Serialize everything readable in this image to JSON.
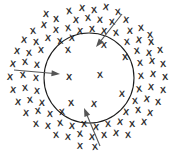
{
  "figure": {
    "title": "",
    "background_color": "#ffffff",
    "marker_glyph": "X",
    "marker_color": "#2b2b2b",
    "boundary_color": "#1c1c1c",
    "arrow_color": "#555555",
    "canvas": {
      "width": 174,
      "height": 152
    }
  },
  "boundary": {
    "shape": "circle",
    "center_x": 89,
    "center_y": 78,
    "radius": 45,
    "stroke_width": 1.1
  },
  "markers_inside": [
    {
      "x": 68,
      "y": 50,
      "size": 9,
      "rotation": -6
    },
    {
      "x": 104,
      "y": 45,
      "size": 9,
      "rotation": 4
    },
    {
      "x": 125,
      "y": 57,
      "size": 9,
      "rotation": -3
    },
    {
      "x": 69,
      "y": 77,
      "size": 9,
      "rotation": 2
    },
    {
      "x": 100,
      "y": 75,
      "size": 9,
      "rotation": -5
    },
    {
      "x": 122,
      "y": 94,
      "size": 9,
      "rotation": 3
    },
    {
      "x": 71,
      "y": 103,
      "size": 9,
      "rotation": -4
    },
    {
      "x": 94,
      "y": 104,
      "size": 9,
      "rotation": 5
    }
  ],
  "markers_outside": [
    {
      "x": 69,
      "y": 11,
      "size": 9,
      "rotation": -8
    },
    {
      "x": 82,
      "y": 8,
      "size": 9,
      "rotation": 6
    },
    {
      "x": 94,
      "y": 10,
      "size": 9,
      "rotation": -4
    },
    {
      "x": 106,
      "y": 7,
      "size": 9,
      "rotation": 9
    },
    {
      "x": 118,
      "y": 12,
      "size": 9,
      "rotation": -6
    },
    {
      "x": 76,
      "y": 20,
      "size": 9,
      "rotation": 5
    },
    {
      "x": 88,
      "y": 18,
      "size": 9,
      "rotation": -7
    },
    {
      "x": 100,
      "y": 20,
      "size": 9,
      "rotation": 3
    },
    {
      "x": 112,
      "y": 22,
      "size": 9,
      "rotation": -5
    },
    {
      "x": 126,
      "y": 20,
      "size": 9,
      "rotation": 7
    },
    {
      "x": 56,
      "y": 19,
      "size": 9,
      "rotation": -3
    },
    {
      "x": 44,
      "y": 25,
      "size": 9,
      "rotation": 8
    },
    {
      "x": 33,
      "y": 31,
      "size": 9,
      "rotation": -6
    },
    {
      "x": 56,
      "y": 30,
      "size": 9,
      "rotation": 4
    },
    {
      "x": 68,
      "y": 28,
      "size": 9,
      "rotation": -9
    },
    {
      "x": 80,
      "y": 31,
      "size": 9,
      "rotation": 5
    },
    {
      "x": 92,
      "y": 29,
      "size": 9,
      "rotation": -4
    },
    {
      "x": 104,
      "y": 31,
      "size": 9,
      "rotation": 6
    },
    {
      "x": 116,
      "y": 33,
      "size": 9,
      "rotation": -7
    },
    {
      "x": 130,
      "y": 31,
      "size": 9,
      "rotation": 3
    },
    {
      "x": 141,
      "y": 28,
      "size": 9,
      "rotation": -5
    },
    {
      "x": 24,
      "y": 40,
      "size": 9,
      "rotation": 7
    },
    {
      "x": 36,
      "y": 42,
      "size": 9,
      "rotation": -4
    },
    {
      "x": 48,
      "y": 38,
      "size": 9,
      "rotation": 5
    },
    {
      "x": 60,
      "y": 41,
      "size": 9,
      "rotation": -8
    },
    {
      "x": 72,
      "y": 38,
      "size": 9,
      "rotation": 4
    },
    {
      "x": 127,
      "y": 42,
      "size": 9,
      "rotation": -6
    },
    {
      "x": 139,
      "y": 40,
      "size": 9,
      "rotation": 8
    },
    {
      "x": 151,
      "y": 42,
      "size": 9,
      "rotation": -3
    },
    {
      "x": 17,
      "y": 51,
      "size": 9,
      "rotation": 6
    },
    {
      "x": 29,
      "y": 53,
      "size": 9,
      "rotation": -5
    },
    {
      "x": 41,
      "y": 50,
      "size": 9,
      "rotation": 4
    },
    {
      "x": 137,
      "y": 51,
      "size": 9,
      "rotation": -7
    },
    {
      "x": 149,
      "y": 53,
      "size": 9,
      "rotation": 5
    },
    {
      "x": 160,
      "y": 50,
      "size": 9,
      "rotation": -4
    },
    {
      "x": 13,
      "y": 64,
      "size": 9,
      "rotation": 8
    },
    {
      "x": 25,
      "y": 62,
      "size": 9,
      "rotation": -6
    },
    {
      "x": 37,
      "y": 65,
      "size": 9,
      "rotation": 3
    },
    {
      "x": 140,
      "y": 63,
      "size": 9,
      "rotation": -5
    },
    {
      "x": 152,
      "y": 61,
      "size": 9,
      "rotation": 7
    },
    {
      "x": 163,
      "y": 64,
      "size": 9,
      "rotation": -4
    },
    {
      "x": 10,
      "y": 77,
      "size": 9,
      "rotation": 5
    },
    {
      "x": 23,
      "y": 75,
      "size": 9,
      "rotation": -7
    },
    {
      "x": 36,
      "y": 78,
      "size": 9,
      "rotation": 4
    },
    {
      "x": 141,
      "y": 76,
      "size": 9,
      "rotation": -6
    },
    {
      "x": 153,
      "y": 74,
      "size": 9,
      "rotation": 6
    },
    {
      "x": 165,
      "y": 77,
      "size": 9,
      "rotation": -3
    },
    {
      "x": 13,
      "y": 90,
      "size": 9,
      "rotation": 7
    },
    {
      "x": 25,
      "y": 88,
      "size": 9,
      "rotation": -5
    },
    {
      "x": 37,
      "y": 91,
      "size": 9,
      "rotation": 4
    },
    {
      "x": 139,
      "y": 89,
      "size": 9,
      "rotation": -8
    },
    {
      "x": 151,
      "y": 87,
      "size": 9,
      "rotation": 5
    },
    {
      "x": 163,
      "y": 90,
      "size": 9,
      "rotation": -4
    },
    {
      "x": 18,
      "y": 102,
      "size": 9,
      "rotation": 6
    },
    {
      "x": 30,
      "y": 100,
      "size": 9,
      "rotation": -6
    },
    {
      "x": 42,
      "y": 103,
      "size": 9,
      "rotation": 3
    },
    {
      "x": 135,
      "y": 101,
      "size": 9,
      "rotation": -5
    },
    {
      "x": 147,
      "y": 99,
      "size": 9,
      "rotation": 8
    },
    {
      "x": 158,
      "y": 102,
      "size": 9,
      "rotation": -4
    },
    {
      "x": 26,
      "y": 113,
      "size": 9,
      "rotation": 5
    },
    {
      "x": 38,
      "y": 111,
      "size": 9,
      "rotation": -7
    },
    {
      "x": 50,
      "y": 114,
      "size": 9,
      "rotation": 4
    },
    {
      "x": 62,
      "y": 112,
      "size": 9,
      "rotation": -5
    },
    {
      "x": 126,
      "y": 112,
      "size": 9,
      "rotation": 6
    },
    {
      "x": 138,
      "y": 110,
      "size": 9,
      "rotation": -4
    },
    {
      "x": 150,
      "y": 113,
      "size": 9,
      "rotation": 7
    },
    {
      "x": 36,
      "y": 124,
      "size": 9,
      "rotation": -6
    },
    {
      "x": 48,
      "y": 126,
      "size": 9,
      "rotation": 4
    },
    {
      "x": 60,
      "y": 123,
      "size": 9,
      "rotation": -8
    },
    {
      "x": 72,
      "y": 126,
      "size": 9,
      "rotation": 5
    },
    {
      "x": 84,
      "y": 124,
      "size": 9,
      "rotation": -4
    },
    {
      "x": 96,
      "y": 127,
      "size": 9,
      "rotation": 6
    },
    {
      "x": 108,
      "y": 124,
      "size": 9,
      "rotation": -5
    },
    {
      "x": 120,
      "y": 122,
      "size": 9,
      "rotation": 7
    },
    {
      "x": 132,
      "y": 124,
      "size": 9,
      "rotation": -3
    },
    {
      "x": 144,
      "y": 122,
      "size": 9,
      "rotation": 5
    },
    {
      "x": 56,
      "y": 135,
      "size": 9,
      "rotation": -6
    },
    {
      "x": 68,
      "y": 137,
      "size": 9,
      "rotation": 4
    },
    {
      "x": 80,
      "y": 134,
      "size": 9,
      "rotation": -7
    },
    {
      "x": 92,
      "y": 137,
      "size": 9,
      "rotation": 5
    },
    {
      "x": 104,
      "y": 135,
      "size": 9,
      "rotation": -4
    },
    {
      "x": 116,
      "y": 133,
      "size": 9,
      "rotation": 6
    },
    {
      "x": 128,
      "y": 135,
      "size": 9,
      "rotation": -5
    },
    {
      "x": 80,
      "y": 146,
      "size": 9,
      "rotation": 4
    },
    {
      "x": 95,
      "y": 147,
      "size": 9,
      "rotation": -6
    },
    {
      "x": 46,
      "y": 14,
      "size": 9,
      "rotation": 5
    },
    {
      "x": 150,
      "y": 35,
      "size": 9,
      "rotation": -5
    }
  ],
  "arrows": [
    {
      "name": "inward-arrow-top-right",
      "x1": 122,
      "y1": 14,
      "x2": 96,
      "y2": 47,
      "head_size": 5
    },
    {
      "name": "inward-arrow-left",
      "x1": 14,
      "y1": 70,
      "x2": 60,
      "y2": 74,
      "head_size": 5
    },
    {
      "name": "inward-arrow-bottom",
      "x1": 100,
      "y1": 146,
      "x2": 84,
      "y2": 108,
      "head_size": 5
    }
  ]
}
